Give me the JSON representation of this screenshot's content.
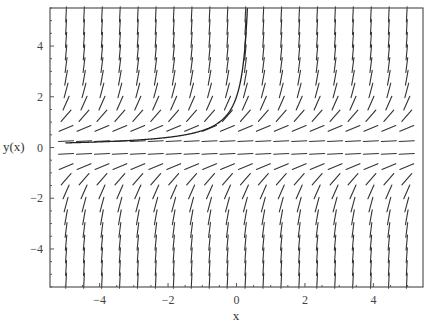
{
  "chart_data": {
    "type": "direction-field",
    "title": "",
    "equation": "dy/dx = y^2",
    "xlabel": "x",
    "ylabel": "y(x)",
    "xlim": [
      -5.45,
      5.45
    ],
    "ylim": [
      -5.5,
      5.5
    ],
    "x_ticks": [
      {
        "value": -4,
        "label": "−4"
      },
      {
        "value": -2,
        "label": "−2"
      },
      {
        "value": 0,
        "label": "0"
      },
      {
        "value": 2,
        "label": "2"
      },
      {
        "value": 4,
        "label": "4"
      }
    ],
    "y_ticks": [
      {
        "value": 4,
        "label": "4"
      },
      {
        "value": 2,
        "label": "2"
      },
      {
        "value": 0,
        "label": "0"
      },
      {
        "value": -2,
        "label": "−2"
      },
      {
        "value": -4,
        "label": "−4"
      }
    ],
    "minor_tick_step": 0.5,
    "grid": false,
    "slope_field": {
      "columns": 20,
      "x_start": -4.98,
      "x_step": 0.524,
      "rows": 22,
      "y_start": -5.25,
      "y_step": 0.5,
      "segment_length_px": 15
    },
    "series": [
      {
        "name": "solution curve y = 1/(0.5 - x), y(0) = 2",
        "x": [
          -5.0,
          -4.5,
          -4.0,
          -3.5,
          -3.0,
          -2.5,
          -2.0,
          -1.5,
          -1.0,
          -0.75,
          -0.5,
          -0.25,
          0.0,
          0.1,
          0.2,
          0.25,
          0.3,
          0.32
        ],
        "y": [
          0.18,
          0.2,
          0.22,
          0.25,
          0.29,
          0.33,
          0.4,
          0.5,
          0.67,
          0.8,
          1.0,
          1.33,
          2.0,
          2.5,
          3.33,
          4.0,
          5.0,
          5.5
        ]
      }
    ],
    "colors": {
      "line": "#222222",
      "frame": "#555555",
      "background": "#ffffff"
    },
    "legend": null
  },
  "plot_area": {
    "left": 50,
    "top": 8,
    "right": 423,
    "bottom": 287
  }
}
